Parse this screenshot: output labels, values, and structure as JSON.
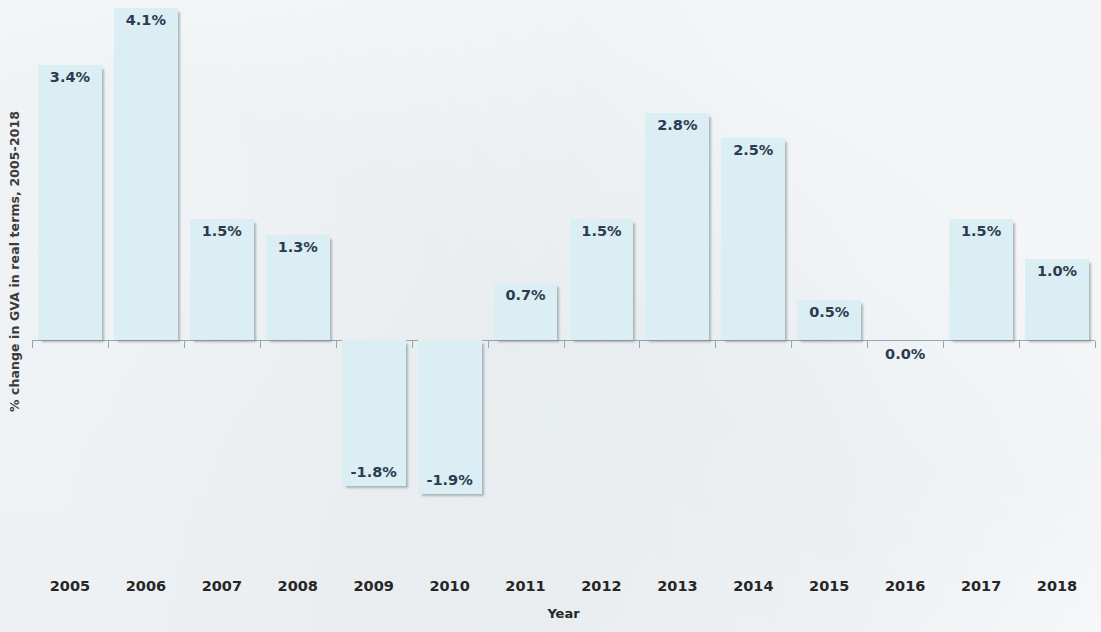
{
  "chart_data": {
    "type": "bar",
    "title": "",
    "xlabel": "Year",
    "ylabel": "% change in GVA in real terms, 2005-2018",
    "categories": [
      "2005",
      "2006",
      "2007",
      "2008",
      "2009",
      "2010",
      "2011",
      "2012",
      "2013",
      "2014",
      "2015",
      "2016",
      "2017",
      "2018"
    ],
    "values": [
      3.4,
      4.1,
      1.5,
      1.3,
      -1.8,
      -1.9,
      0.7,
      1.5,
      2.8,
      2.5,
      0.5,
      0.0,
      1.5,
      1.0
    ],
    "data_labels": [
      "3.4%",
      "4.1%",
      "1.5%",
      "1.3%",
      "-1.8%",
      "-1.9%",
      "0.7%",
      "1.5%",
      "2.8%",
      "2.5%",
      "0.5%",
      "0.0%",
      "1.5%",
      "1.0%"
    ],
    "series": [
      {
        "name": "% change in GVA in real terms",
        "values": [
          3.4,
          4.1,
          1.5,
          1.3,
          -1.8,
          -1.9,
          0.7,
          1.5,
          2.8,
          2.5,
          0.5,
          0.0,
          1.5,
          1.0
        ]
      }
    ],
    "ylim": [
      -2.6,
      4.3
    ],
    "grid": false,
    "legend": "none",
    "bar_fill_color": "#daeef3",
    "label_color": "#2d3b50",
    "axis_color": "#9aa3a8"
  },
  "axes": {
    "y_title": "% change in GVA in real terms, 2005-2018",
    "x_title": "Year"
  }
}
